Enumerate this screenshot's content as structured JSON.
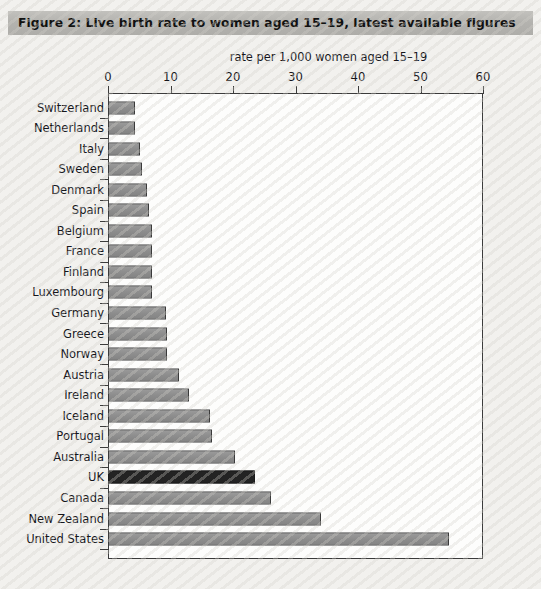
{
  "figure": {
    "title": "Figure 2:  Live birth rate to women aged 15–19, latest available figures"
  },
  "chart_data": {
    "type": "bar",
    "orientation": "horizontal",
    "title": "Figure 2:  Live birth rate to women aged 15–19, latest available figures",
    "subtitle": "rate per 1,000 women aged 15–19",
    "xlabel": "rate per 1,000 women aged 15–19",
    "ylabel": "",
    "xlim": [
      0,
      60
    ],
    "xticks": [
      0,
      10,
      20,
      30,
      40,
      50,
      60
    ],
    "grid": false,
    "legend": false,
    "highlight_category": "UK",
    "highlight_color": "#232323",
    "bar_color": "#8d8d8d",
    "categories": [
      "Switzerland",
      "Netherlands",
      "Italy",
      "Sweden",
      "Denmark",
      "Spain",
      "Belgium",
      "France",
      "Finland",
      "Luxembourg",
      "Germany",
      "Greece",
      "Norway",
      "Austria",
      "Ireland",
      "Iceland",
      "Portugal",
      "Australia",
      "UK",
      "Canada",
      "New Zealand",
      "United States"
    ],
    "values": [
      4.3,
      4.3,
      5.1,
      5.4,
      6.2,
      6.6,
      7.0,
      7.1,
      7.1,
      7.1,
      9.3,
      9.4,
      9.4,
      11.3,
      12.9,
      16.3,
      16.6,
      20.3,
      23.5,
      26.0,
      34.0,
      54.5
    ]
  }
}
